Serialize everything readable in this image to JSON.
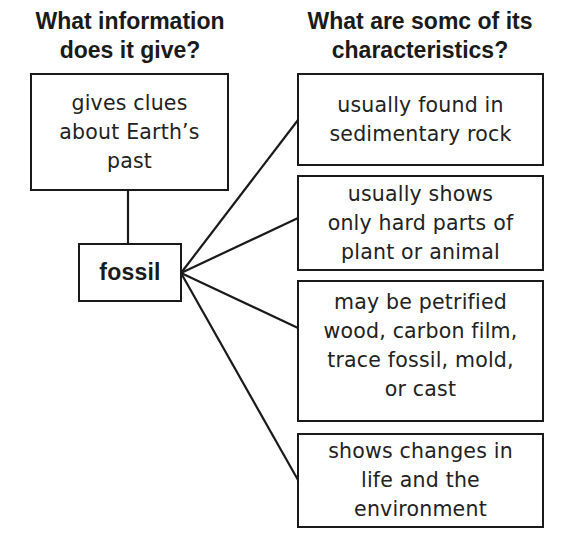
{
  "headings": {
    "left": [
      "What information",
      "does it give?"
    ],
    "right": [
      "What are somc of its",
      "characteristics?"
    ]
  },
  "center_node": {
    "label": "fossil"
  },
  "info_node": {
    "lines": [
      "gives clues",
      "about Earth’s",
      "past"
    ]
  },
  "characteristics": [
    {
      "lines": [
        "usually found in",
        "sedimentary rock"
      ]
    },
    {
      "lines": [
        "usually shows",
        "only hard parts of",
        "plant or animal"
      ]
    },
    {
      "lines": [
        "may be petrified",
        "wood, carbon film,",
        "trace fossil, mold,",
        "or cast"
      ]
    },
    {
      "lines": [
        "shows changes in",
        "life and the",
        "environment"
      ]
    }
  ],
  "colors": {
    "line": "#1a1a1a",
    "background": "#ffffff"
  }
}
